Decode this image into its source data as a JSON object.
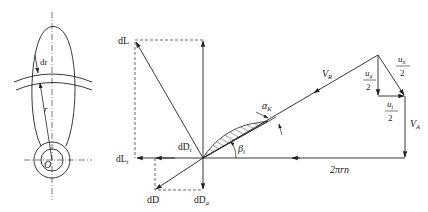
{
  "diagram": {
    "type": "propeller blade element velocity and force diagram",
    "colors": {
      "stroke": "#222222",
      "background": "#ffffff"
    },
    "blade_view": {
      "labels": {
        "dr": "dr",
        "r": "r",
        "origin": "O"
      }
    },
    "force_diagram": {
      "labels": {
        "dL": "dL",
        "dLt_main": "dL",
        "dLt_sub": "t",
        "dD": "dD",
        "dDa_main": "dD",
        "dDa_sub": "a",
        "dDt_main": "dD",
        "dDt_sub": "t",
        "alpha_main": "α",
        "alpha_sub": "K",
        "beta_main": "β",
        "beta_sub": "i",
        "VR_main": "V",
        "VR_sub": "R",
        "VA_main": "V",
        "VA_sub": "A",
        "two_pi_rn": "2πrn",
        "un_num_main": "u",
        "un_num_sub": "n",
        "ua_num_main": "u",
        "ua_num_sub": "a",
        "ut_num_main": "u",
        "ut_num_sub": "t",
        "den": "2"
      }
    }
  }
}
